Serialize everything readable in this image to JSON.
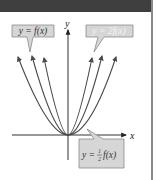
{
  "figure": {
    "axes": {
      "x_label": "x",
      "y_label": "y"
    },
    "labels": {
      "base": "y = f(x)",
      "stretched": "y = 2f(x)",
      "compressed_prefix": "y = ",
      "compressed_frac_num": "1",
      "compressed_frac_den": "2",
      "compressed_suffix": "f(x)"
    },
    "curves": [
      {
        "name": "y = 2f(x)",
        "role": "vertical stretch",
        "relative_scale": 2
      },
      {
        "name": "y = f(x)",
        "role": "original",
        "relative_scale": 1
      },
      {
        "name": "y = 1/2 f(x)",
        "role": "vertical compression",
        "relative_scale": 0.5
      }
    ],
    "colors": {
      "header": "#3f3f3f",
      "curve": "#4a4a4a",
      "label_box_fill": "#d6d6d6",
      "label_box_stroke": "#8a8a8a",
      "axis": "#333333"
    }
  }
}
